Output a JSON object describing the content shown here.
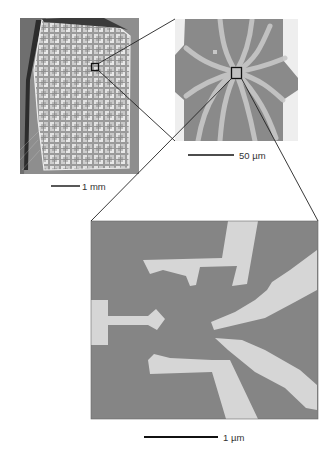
{
  "figure": {
    "panels": [
      {
        "id": "chip-photo",
        "description": "Photograph of a chip with an array of devices",
        "scale_bar": {
          "label": "1 mm"
        }
      },
      {
        "id": "device-sem-50um",
        "description": "Micrograph of one device with radial electrode fingers",
        "scale_bar": {
          "label": "50 µm"
        }
      },
      {
        "id": "device-sem-1um",
        "description": "High-magnification micrograph of electrode tips and gates",
        "scale_bar": {
          "label": "1 µm"
        }
      }
    ],
    "colors": {
      "background": "#ffffff",
      "substrate_gray": "#8a8a8a",
      "electrode_light": "#d8d8d8",
      "line_dark": "#222222"
    }
  }
}
